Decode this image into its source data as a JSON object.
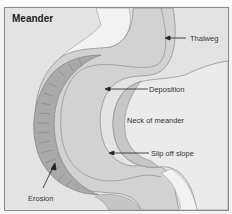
{
  "diagram": {
    "title": "Meander",
    "labels": {
      "thalweg": "Thalweg",
      "deposition": "Deposition",
      "neck": "Neck of meander",
      "slip_off_slope": "Slip off slope",
      "erosion": "Erosion"
    },
    "colors": {
      "background": "#e3e3e3",
      "river": "#d2d2d2",
      "outer_bank": "#a9a9a9",
      "slip_slope": "#c6c6c6",
      "inner_land": "#ebebeb",
      "light_band": "#f2f2f2",
      "thalweg_line": "#8f8f8f",
      "text": "#333333"
    }
  }
}
